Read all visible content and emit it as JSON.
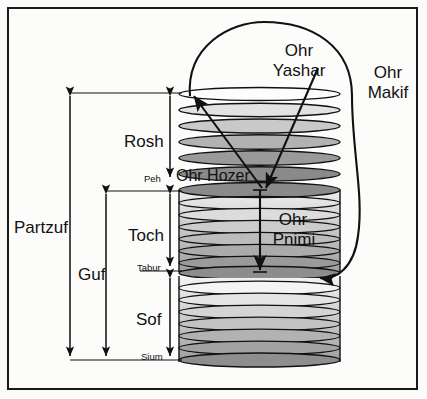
{
  "diagram": {
    "frame": {
      "border_color": "#1a1a1a",
      "background": "#fcfcfb"
    },
    "labels": {
      "partzuf": "Partzuf",
      "guf": "Guf",
      "rosh": "Rosh",
      "toch": "Toch",
      "sof": "Sof",
      "peh": "Peh",
      "tabur": "Tabur",
      "sium": "Sium",
      "ohr_yashar_l1": "Ohr",
      "ohr_yashar_l2": "Yashar",
      "ohr_makif_l1": "Ohr",
      "ohr_makif_l2": "Makif",
      "ohr_hozer": "Ohr Hozer",
      "ohr_pnimi_l1": "Ohr",
      "ohr_pnimi_l2": "Pnimi"
    },
    "sections": [
      {
        "name": "Rosh",
        "kind": "stacked-ellipses",
        "top": 92,
        "bottom": 178,
        "rings": 6
      },
      {
        "name": "Toch",
        "kind": "cylinder",
        "top": 190,
        "bottom": 272,
        "rings": 8
      },
      {
        "name": "Sof",
        "kind": "cylinder",
        "top": 272,
        "bottom": 360,
        "rings": 8
      }
    ],
    "measures": [
      {
        "name": "Partzuf",
        "x": 70,
        "top": 92,
        "bottom": 360
      },
      {
        "name": "Guf",
        "x": 105,
        "top": 190,
        "bottom": 360
      },
      {
        "name": "Rosh",
        "x": 170,
        "top": 92,
        "bottom": 178
      },
      {
        "name": "Toch",
        "x": 170,
        "top": 190,
        "bottom": 266
      },
      {
        "name": "Sof",
        "x": 170,
        "top": 276,
        "bottom": 360
      }
    ],
    "markers": [
      {
        "name": "Peh",
        "y": 182
      },
      {
        "name": "Tabur",
        "y": 271
      },
      {
        "name": "Sium",
        "y": 360
      }
    ],
    "colors": {
      "ink": "#111111",
      "ring_light": "#fdfdfd",
      "ring_mid": "#b9b9b9",
      "ring_dark": "#7e7e7e",
      "cyl_light": "#e8e8e8",
      "cyl_dark": "#9a9a9a"
    },
    "geometry": {
      "cyl_left": 179,
      "cyl_right": 340,
      "cyl_cx": 259.5,
      "cyl_rx": 80.5,
      "ring_ry": 7
    }
  }
}
